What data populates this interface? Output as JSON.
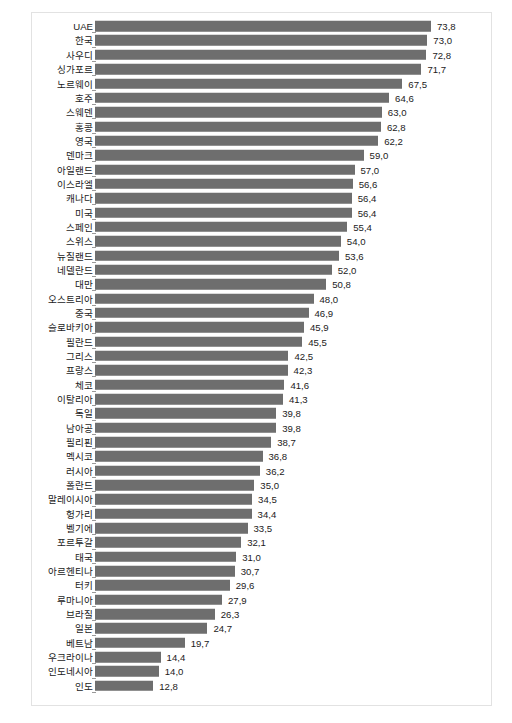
{
  "chart_data": {
    "type": "bar",
    "orientation": "horizontal",
    "title": "",
    "subtitle": "",
    "xlabel": "",
    "ylabel": "",
    "grid": false,
    "legend": null,
    "legend_position": "none",
    "xlim": [
      0,
      78
    ],
    "axis_tick_labels": [],
    "bar_color": "#6e6e6e",
    "text_color": "#1b1b1b",
    "frame_color": "#e2e2e2",
    "value_decimal_separator": ",",
    "categories": [
      "UAE",
      "한국",
      "사우디",
      "싱가포르",
      "노르웨이",
      "호주",
      "스웨덴",
      "홍콩",
      "영국",
      "덴마크",
      "아일랜드",
      "이스라엘",
      "캐나다",
      "미국",
      "스페인",
      "스위스",
      "뉴질랜드",
      "네델란드",
      "대만",
      "오스트리아",
      "중국",
      "슬로바키아",
      "필란드",
      "그리스",
      "프랑스",
      "체코",
      "이탈리아",
      "독일",
      "남아공",
      "필리핀",
      "멕시코",
      "러시아",
      "폴란드",
      "말레이시아",
      "헝가리",
      "벨기에",
      "포르투갈",
      "태국",
      "아르헨티나",
      "터키",
      "루마니아",
      "브라질",
      "일본",
      "베트남",
      "우크라이나",
      "인도네시아",
      "인도"
    ],
    "values": [
      73.8,
      73.0,
      72.8,
      71.7,
      67.5,
      64.6,
      63.0,
      62.8,
      62.2,
      59.0,
      57.0,
      56.6,
      56.4,
      56.4,
      55.4,
      54.0,
      53.6,
      52.0,
      50.8,
      48.0,
      46.9,
      45.9,
      45.5,
      42.5,
      42.3,
      41.6,
      41.3,
      39.8,
      39.8,
      38.7,
      36.8,
      36.2,
      35.0,
      34.5,
      34.4,
      33.5,
      32.1,
      31.0,
      30.7,
      29.6,
      27.9,
      26.3,
      24.7,
      19.7,
      14.4,
      14.0,
      12.8
    ],
    "value_labels": [
      "73,8",
      "73,0",
      "72,8",
      "71,7",
      "67,5",
      "64,6",
      "63,0",
      "62,8",
      "62,2",
      "59,0",
      "57,0",
      "56,6",
      "56,4",
      "56,4",
      "55,4",
      "54,0",
      "53,6",
      "52,0",
      "50,8",
      "48,0",
      "46,9",
      "45,9",
      "45,5",
      "42,5",
      "42,3",
      "41,6",
      "41,3",
      "39,8",
      "39,8",
      "38,7",
      "36,8",
      "36,2",
      "35,0",
      "34,5",
      "34,4",
      "33,5",
      "32,1",
      "31,0",
      "30,7",
      "29,6",
      "27,9",
      "26,3",
      "24,7",
      "19,7",
      "14,4",
      "14,0",
      "12,8"
    ]
  },
  "caption": {
    "text": ""
  }
}
